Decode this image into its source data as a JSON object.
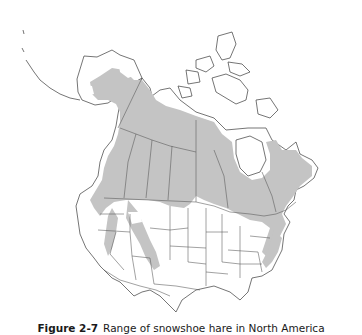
{
  "figure": {
    "label": "Figure 2-7",
    "caption": "Range of snowshoe hare in North America"
  },
  "map": {
    "region": "North America",
    "subject": "snowshoe hare range",
    "colors": {
      "range_fill": "#c4c4c4",
      "land_fill": "#ffffff",
      "border_stroke": "#444444",
      "background": "#ffffff"
    },
    "legend": []
  }
}
